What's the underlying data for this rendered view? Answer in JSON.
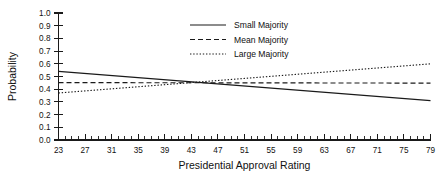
{
  "chart_data": {
    "type": "line",
    "title": "",
    "xlabel": "Presidential Approval Rating",
    "ylabel": "Probability",
    "xlim": [
      23,
      79
    ],
    "ylim": [
      0.0,
      1.0
    ],
    "grid": false,
    "legend_position": "top-center",
    "x_ticks": [
      23,
      27,
      31,
      35,
      39,
      43,
      47,
      51,
      55,
      59,
      63,
      67,
      71,
      75,
      79
    ],
    "x_tick_labels": [
      "23",
      "27",
      "31",
      "35",
      "39",
      "43",
      "47",
      "51",
      "55",
      "59",
      "63",
      "67",
      "71",
      "75",
      "79"
    ],
    "x_minor_tick_step": 1,
    "y_ticks": [
      0.0,
      0.1,
      0.2,
      0.3,
      0.4,
      0.5,
      0.6,
      0.7,
      0.8,
      0.9,
      1.0
    ],
    "y_tick_labels": [
      "0.0",
      "0.1",
      "0.2",
      "0.3",
      "0.4",
      "0.5",
      "0.6",
      "0.7",
      "0.8",
      "0.9",
      "1.0"
    ],
    "x": [
      23,
      79
    ],
    "series": [
      {
        "name": "Small Majority",
        "style": "solid",
        "color": "#1a1a1a",
        "values": [
          0.54,
          0.31
        ]
      },
      {
        "name": "Mean Majority",
        "style": "dashed",
        "color": "#1a1a1a",
        "values": [
          0.452,
          0.448
        ]
      },
      {
        "name": "Large Majority",
        "style": "dotted",
        "color": "#1a1a1a",
        "values": [
          0.37,
          0.6
        ]
      }
    ]
  },
  "legend": {
    "items": [
      {
        "label": "Small Majority",
        "style": "solid"
      },
      {
        "label": "Mean Majority",
        "style": "dashed"
      },
      {
        "label": "Large Majority",
        "style": "dotted"
      }
    ]
  }
}
